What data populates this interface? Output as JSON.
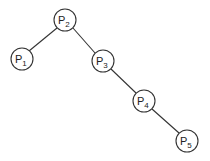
{
  "diagram": {
    "type": "tree",
    "nodes": [
      {
        "id": "P2",
        "label": "P",
        "sub": "2",
        "x": 65,
        "y": 20
      },
      {
        "id": "P1",
        "label": "P",
        "sub": "1",
        "x": 22,
        "y": 59
      },
      {
        "id": "P3",
        "label": "P",
        "sub": "3",
        "x": 103,
        "y": 61
      },
      {
        "id": "P4",
        "label": "P",
        "sub": "4",
        "x": 144,
        "y": 101
      },
      {
        "id": "P5",
        "label": "P",
        "sub": "5",
        "x": 187,
        "y": 141
      }
    ],
    "edges": [
      [
        "P2",
        "P1"
      ],
      [
        "P2",
        "P3"
      ],
      [
        "P3",
        "P4"
      ],
      [
        "P4",
        "P5"
      ]
    ]
  }
}
